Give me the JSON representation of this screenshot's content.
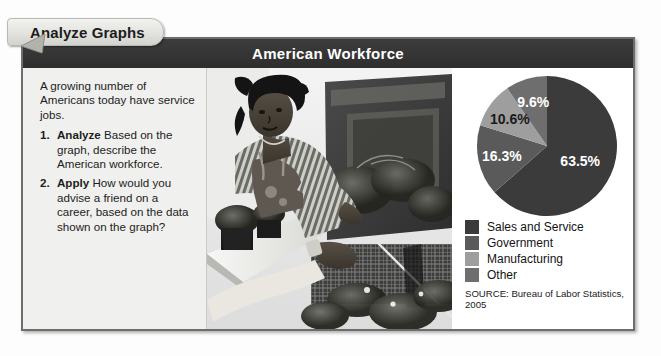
{
  "tab": {
    "label": "Analyze Graphs",
    "arrow_icon": "left-pointer-arrow-icon"
  },
  "card": {
    "header_title": "American Workforce"
  },
  "text_panel": {
    "intro": "A growing number of Americans today have service jobs.",
    "questions": [
      {
        "number": "1.",
        "lead": "Analyze",
        "body": "Based on the graph, describe the American workforce."
      },
      {
        "number": "2.",
        "lead": "Apply",
        "body": "How would you advise a friend on a career, based on the data shown on the graph?"
      }
    ]
  },
  "photo": {
    "alt": "Black and white photograph of a woman wearing an apron handing potted plants across a counter at an outdoor garden stand",
    "name": "garden-worker-photo"
  },
  "chart_data": {
    "type": "pie",
    "title": "American Workforce",
    "categories": [
      "Sales and Service",
      "Government",
      "Manufacturing",
      "Other"
    ],
    "values": [
      63.5,
      16.3,
      10.6,
      9.6
    ],
    "value_labels": [
      "63.5%",
      "16.3%",
      "10.6%",
      "9.6%"
    ],
    "colors": [
      "#3b3b3b",
      "#5a5a5a",
      "#9e9e9e",
      "#6e6e6e"
    ],
    "label_colors": [
      "#ffffff",
      "#ffffff",
      "#1a1a1a",
      "#ffffff"
    ],
    "legend_position": "below",
    "source": "SOURCE: Bureau of Labor Statistics, 2005"
  },
  "colors": {
    "header_bar": "#343434",
    "frame_border": "#6d6d6d",
    "text_panel_bg": "#f0f0ee",
    "page_bg": "#fdfdfd"
  }
}
